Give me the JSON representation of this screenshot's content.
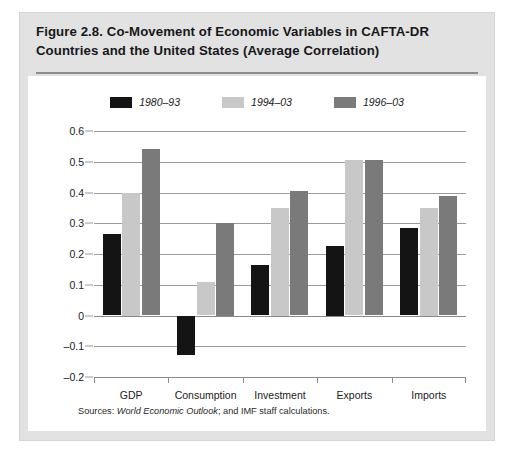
{
  "figure": {
    "title": "Figure 2.8.  Co-Movement of Economic Variables in CAFTA-DR Countries and the United States (Average Correlation)",
    "source_prefix": "Sources: ",
    "source_italic": "World Economic Outlook",
    "source_suffix": "; and IMF staff calculations."
  },
  "colors": {
    "series_1980_93": "#141414",
    "series_1994_03": "#c8c8c8",
    "series_1996_03": "#7a7a7a",
    "panel_background": "#e2e2e2",
    "plot_background": "#ffffff",
    "gridline": "#9a9a9a",
    "text": "#1b1b1b"
  },
  "chart_data": {
    "type": "bar",
    "title": "Figure 2.8.  Co-Movement of Economic Variables in CAFTA-DR Countries and the United States (Average Correlation)",
    "xlabel": "",
    "ylabel": "",
    "ylim": [
      -0.2,
      0.6
    ],
    "yticks": [
      0.6,
      0.5,
      0.4,
      0.3,
      0.2,
      0.1,
      0,
      -0.1,
      -0.2
    ],
    "ytick_labels": [
      "0.6",
      "0.5",
      "0.4",
      "0.3",
      "0.2",
      "0.1",
      "0",
      "–0.1",
      "–0.2"
    ],
    "grid": true,
    "legend_position": "top-center",
    "categories": [
      "GDP",
      "Consumption",
      "Investment",
      "Exports",
      "Imports"
    ],
    "series": [
      {
        "name": "1980–93",
        "color": "#141414",
        "values": [
          0.265,
          -0.13,
          0.165,
          0.225,
          0.285
        ]
      },
      {
        "name": "1994–03",
        "color": "#c8c8c8",
        "values": [
          0.4,
          0.11,
          0.35,
          0.505,
          0.35
        ]
      },
      {
        "name": "1996–03",
        "color": "#7a7a7a",
        "values": [
          0.54,
          0.3,
          0.405,
          0.505,
          0.39
        ]
      }
    ]
  }
}
